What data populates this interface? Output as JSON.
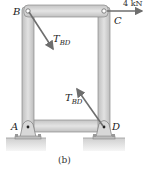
{
  "figure": {
    "caption": "(b)",
    "points": {
      "A": "A",
      "B": "B",
      "C": "C",
      "D": "D"
    },
    "forces": {
      "applied_load": "4 kN",
      "tension_main": "T",
      "tension_sub": "BD"
    },
    "colors": {
      "member_fill": "#d6d6d6",
      "member_edge": "#8a8a8a",
      "arrow": "#6e6e6e",
      "ground": "#e4e4e4",
      "text": "#222222"
    }
  }
}
